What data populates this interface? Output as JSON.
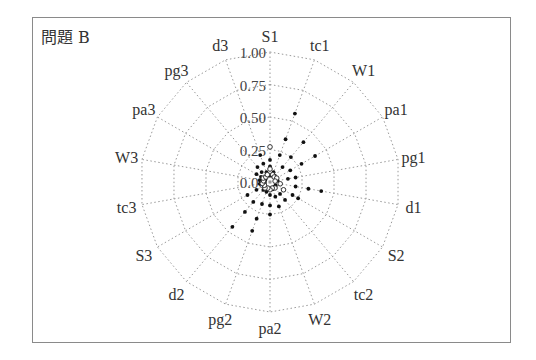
{
  "panel": {
    "title": "問題 B"
  },
  "chart_data": {
    "type": "radar",
    "title": "問題 B",
    "axes": [
      "S1",
      "tc1",
      "W1",
      "pa1",
      "pg1",
      "d1",
      "S2",
      "tc2",
      "W2",
      "pa2",
      "pg2",
      "d2",
      "S3",
      "tc3",
      "W3",
      "pa3",
      "pg3",
      "d3"
    ],
    "radial_ticks": [
      "0.00",
      "0.25",
      "0.50",
      "0.75",
      "1.00"
    ],
    "rlim": [
      0,
      1
    ],
    "grid": "polygon-dotted",
    "series": [
      {
        "name": "filled-points",
        "marker": "dot",
        "values": [
          [
            0.05,
            0.12,
            0.17
          ],
          [
            0.08,
            0.22,
            0.35,
            0.56
          ],
          [
            0.06,
            0.15,
            0.25,
            0.4
          ],
          [
            0.05,
            0.18,
            0.28,
            0.4
          ],
          [
            0.06,
            0.14,
            0.2
          ],
          [
            0.08,
            0.2,
            0.3,
            0.4
          ],
          [
            0.05,
            0.12,
            0.2,
            0.25
          ],
          [
            0.05,
            0.12,
            0.18
          ],
          [
            0.06,
            0.12,
            0.2
          ],
          [
            0.05,
            0.1,
            0.18,
            0.25
          ],
          [
            0.08,
            0.18,
            0.3,
            0.4
          ],
          [
            0.08,
            0.2,
            0.3,
            0.45
          ],
          [
            0.05,
            0.12,
            0.2
          ],
          [
            0.04,
            0.08
          ],
          [
            0.04,
            0.08
          ],
          [
            0.04,
            0.08,
            0.12
          ],
          [
            0.05,
            0.1,
            0.15
          ],
          [
            0.08,
            0.15,
            0.22
          ]
        ]
      },
      {
        "name": "open-points",
        "marker": "circle",
        "values": [
          [
            0.27,
            0.1
          ],
          [
            0.06
          ],
          [
            0.05
          ],
          [
            0.06
          ],
          [
            0.04
          ],
          [
            0.08
          ],
          [
            0.12
          ],
          [
            0.06
          ],
          [
            0.05
          ],
          [
            0.06
          ],
          [
            0.05
          ],
          [
            0.06
          ],
          [
            0.05
          ],
          [
            0.06
          ],
          [
            0.05
          ],
          [
            0.06
          ],
          [
            0.05
          ],
          [
            0.06
          ]
        ]
      }
    ]
  }
}
